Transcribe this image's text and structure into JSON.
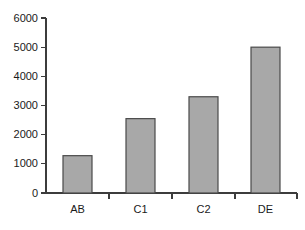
{
  "chart_data": {
    "type": "bar",
    "title": "",
    "subtitle": "",
    "xlabel": "",
    "ylabel": "",
    "categories": [
      "AB",
      "C1",
      "C2",
      "DE"
    ],
    "values": [
      1280,
      2550,
      3300,
      5000
    ],
    "series": [
      {
        "name": "",
        "values": [
          1280,
          2550,
          3300,
          5000
        ]
      }
    ],
    "ylim": [
      0,
      6000
    ],
    "ytick_values": [
      0,
      1000,
      2000,
      3000,
      4000,
      5000,
      6000
    ],
    "ytick_labels": [
      "0",
      "1000",
      "2000",
      "3000",
      "4000",
      "5000",
      "6000"
    ],
    "grid": false,
    "legend": false,
    "legend_position": "none",
    "bar_fill_color": "#a8a8a8",
    "bar_border_color": "#4a4a4a",
    "axis_color": "#3c3c3c",
    "background_color": "#ffffff"
  },
  "axis": {
    "y_label_0": "0",
    "y_label_1000": "1000",
    "y_label_2000": "2000",
    "y_label_3000": "3000",
    "y_label_4000": "4000",
    "y_label_5000": "5000",
    "y_label_6000": "6000",
    "x_label_ab": "AB",
    "x_label_c1": "C1",
    "x_label_c2": "C2",
    "x_label_de": "DE"
  }
}
